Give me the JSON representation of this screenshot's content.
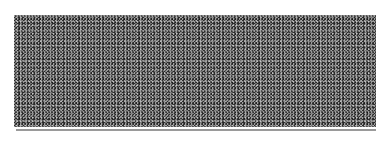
{
  "panel": {
    "type": "noise-texture",
    "base_color": "#2a2a2a",
    "speckle_color": "#e6e6e6"
  },
  "rule": {
    "color": "#9a9a9a"
  }
}
